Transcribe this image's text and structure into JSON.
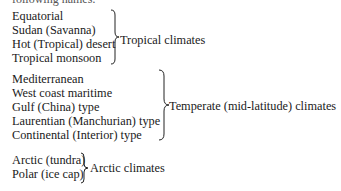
{
  "header_partial": "following names:",
  "groups": [
    {
      "name": "tropical",
      "items": [
        "Equatorial",
        "Sudan (Savanna)",
        "Hot (Tropical) desert",
        "Tropical monsoon"
      ],
      "label": "Tropical climates"
    },
    {
      "name": "temperate",
      "items": [
        "Mediterranean",
        "West coast maritime",
        "Gulf (China) type",
        "Laurentian (Manchurian) type",
        "Continental (Interior) type"
      ],
      "label": "Temperate (mid-latitude) climates"
    },
    {
      "name": "arctic",
      "items": [
        "Arctic (tundra)",
        "Polar (ice cap)"
      ],
      "label": "Arctic climates"
    }
  ]
}
